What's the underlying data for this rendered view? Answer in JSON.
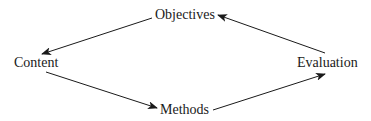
{
  "diagram": {
    "type": "cycle",
    "nodes": [
      {
        "id": "objectives",
        "label": "Objectives"
      },
      {
        "id": "content",
        "label": "Content"
      },
      {
        "id": "methods",
        "label": "Methods"
      },
      {
        "id": "evaluation",
        "label": "Evaluation"
      }
    ],
    "edges": [
      {
        "from": "objectives",
        "to": "content"
      },
      {
        "from": "content",
        "to": "methods"
      },
      {
        "from": "methods",
        "to": "evaluation"
      },
      {
        "from": "evaluation",
        "to": "objectives"
      }
    ],
    "colors": {
      "text": "#1a1a1a",
      "arrow": "#1a1a1a",
      "background": "#ffffff"
    }
  }
}
